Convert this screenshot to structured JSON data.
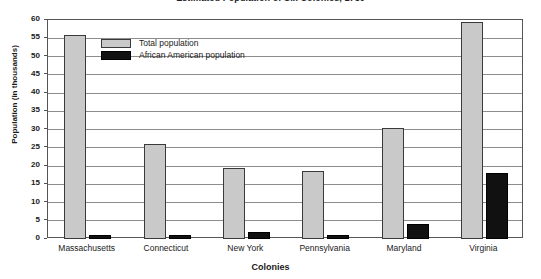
{
  "chart_data": {
    "type": "bar",
    "title": "Estimated Population of Six Colonies, 1750",
    "xlabel": "Colonies",
    "ylabel": "Population (in thousands)",
    "categories": [
      "Massachusetts",
      "Connecticut",
      "New York",
      "Pennsylvania",
      "Maryland",
      "Virginia"
    ],
    "series": [
      {
        "name": "Total population",
        "color": "#c9c9c9",
        "values": [
          56,
          26,
          19.5,
          18.5,
          30.5,
          59.5
        ]
      },
      {
        "name": "African American population",
        "color": "#111111",
        "values": [
          1,
          1,
          2,
          1,
          4,
          18
        ]
      }
    ],
    "ylim": [
      0,
      60
    ],
    "ytick_step": 5,
    "yticks": [
      0,
      5,
      10,
      15,
      20,
      25,
      30,
      35,
      40,
      45,
      50,
      55,
      60
    ],
    "ytick_labels": [
      "0",
      "5",
      "10",
      "15",
      "20",
      "25",
      "30",
      "35",
      "40",
      "45",
      "50",
      "55",
      "60"
    ],
    "grid": true,
    "legend_position": "upper-left-inside"
  }
}
